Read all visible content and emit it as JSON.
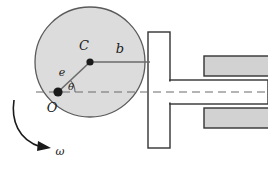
{
  "diagram": {
    "background_color": "#ffffff",
    "cam": {
      "name": "circular-cam-disk",
      "shape": "circle",
      "fill_color": "#dcdcdc",
      "stroke_color": "#5a5a5a",
      "center_x": 90,
      "center_y": 62,
      "radius": 55
    },
    "points": [
      {
        "id": "center",
        "label": "C",
        "description": "geometric center of cam disk",
        "x": 90,
        "y": 62,
        "label_x": 84,
        "label_y": 50,
        "marker_color": "#1a1a1a"
      },
      {
        "id": "pivot",
        "label": "O",
        "description": "rotation pivot of cam",
        "x": 58,
        "y": 92,
        "label_x": 52,
        "label_y": 110,
        "marker_color": "#1a1a1a"
      }
    ],
    "dimensions": [
      {
        "id": "eccentricity",
        "label": "e",
        "description": "offset distance from pivot O to center C",
        "label_x": 62,
        "label_y": 74,
        "from_x": 58,
        "from_y": 92,
        "to_x": 90,
        "to_y": 62
      },
      {
        "id": "contact-distance",
        "label": "b",
        "description": "horizontal distance from center C to follower face",
        "label_x": 118,
        "label_y": 52,
        "from_x": 90,
        "from_y": 62,
        "to_x": 150,
        "to_y": 62
      }
    ],
    "angle": {
      "id": "cam-angle",
      "label": "θ",
      "description": "cam rotation angle measured from horizontal centerline",
      "label_x": 71,
      "label_y": 88,
      "vertex_x": 58,
      "vertex_y": 92,
      "arc_radius": 17,
      "degrees": 43
    },
    "rotation": {
      "id": "angular-velocity",
      "label": "ω",
      "description": "angular velocity, counterclockwise sense shown by curved arrow",
      "label_x": 57,
      "label_y": 152,
      "arrow_color": "#1a1a1a"
    },
    "centerline": {
      "id": "horizontal-centerline",
      "y": 92,
      "from_x": 36,
      "to_x": 268,
      "style": "dashed",
      "color": "#6b6b6b"
    },
    "follower": {
      "name": "flat-faced-translating-follower",
      "fill_color": "#ffffff",
      "stroke_color": "#333333",
      "face": {
        "x": 148,
        "y": 32,
        "width": 22,
        "height": 116
      },
      "stem": {
        "x": 170,
        "y": 80,
        "width": 98,
        "height": 24
      }
    },
    "guides": [
      {
        "id": "upper-guide-block",
        "fill_color": "#d2d2d2",
        "stroke_color": "#333333",
        "x": 204,
        "y": 56,
        "width": 64,
        "height": 20
      },
      {
        "id": "lower-guide-block",
        "fill_color": "#d2d2d2",
        "stroke_color": "#333333",
        "x": 204,
        "y": 108,
        "width": 64,
        "height": 20
      }
    ]
  }
}
